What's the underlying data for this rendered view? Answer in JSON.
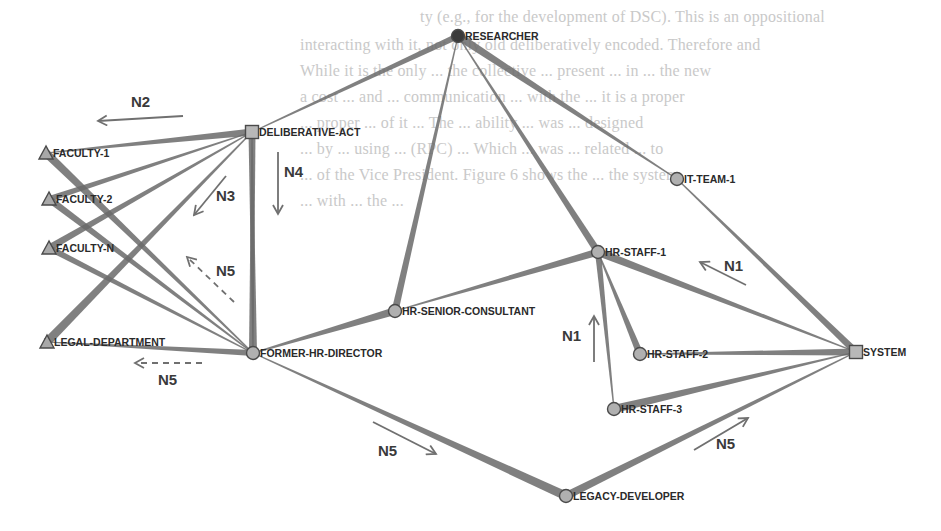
{
  "diagram": {
    "title": "",
    "type": "network",
    "background_text_lines": [
      "ty (e.g., for the development of DSC). This is an oppositional",
      "interacting with it, not only old deliberatively encoded. Therefore and",
      "While it is the only ... the collective ... present ... in ... the new",
      "a cost ... and ... communication ... with the ... it is a proper",
      "... proper ... of it ... The ... ability ... was ... designed",
      "... by ... using ... (RPC) ... Which ... was ... related ... to",
      "... of the Vice President. Figure 6 shows the ... the system",
      "... with ... the ..."
    ],
    "nodes": [
      {
        "id": "researcher",
        "label": "RESEARCHER",
        "shape": "circle",
        "fill": "#3a3a3a",
        "x": 458,
        "y": 36
      },
      {
        "id": "deliberative-act",
        "label": "DELIBERATIVE-ACT",
        "shape": "square",
        "fill": "#b8b8b8",
        "x": 252,
        "y": 132
      },
      {
        "id": "faculty-1",
        "label": "FACULTY-1",
        "shape": "triangle",
        "fill": "#a8a8a8",
        "x": 46,
        "y": 153
      },
      {
        "id": "faculty-2",
        "label": "FACULTY-2",
        "shape": "triangle",
        "fill": "#a8a8a8",
        "x": 49,
        "y": 199
      },
      {
        "id": "faculty-n",
        "label": "FACULTY-N",
        "shape": "triangle",
        "fill": "#a8a8a8",
        "x": 49,
        "y": 248
      },
      {
        "id": "legal-department",
        "label": "LEGAL-DEPARTMENT",
        "shape": "triangle",
        "fill": "#a8a8a8",
        "x": 47,
        "y": 342
      },
      {
        "id": "former-hr-director",
        "label": "FORMER-HR-DIRECTOR",
        "shape": "circle",
        "fill": "#b0b0b0",
        "x": 253,
        "y": 353
      },
      {
        "id": "hr-senior-consultant",
        "label": "HR-SENIOR-CONSULTANT",
        "shape": "circle",
        "fill": "#b0b0b0",
        "x": 395,
        "y": 311
      },
      {
        "id": "it-team-1",
        "label": "IT-TEAM-1",
        "shape": "circle",
        "fill": "#b0b0b0",
        "x": 677,
        "y": 179
      },
      {
        "id": "hr-staff-1",
        "label": "HR-STAFF-1",
        "shape": "circle",
        "fill": "#b0b0b0",
        "x": 598,
        "y": 252
      },
      {
        "id": "hr-staff-2",
        "label": "HR-STAFF-2",
        "shape": "circle",
        "fill": "#b0b0b0",
        "x": 640,
        "y": 354
      },
      {
        "id": "hr-staff-3",
        "label": "HR-STAFF-3",
        "shape": "circle",
        "fill": "#b0b0b0",
        "x": 614,
        "y": 409
      },
      {
        "id": "system",
        "label": "SYSTEM",
        "shape": "square",
        "fill": "#b8b8b8",
        "x": 856,
        "y": 352
      },
      {
        "id": "legacy-developer",
        "label": "LEGACY-DEVELOPER",
        "shape": "circle",
        "fill": "#b0b0b0",
        "x": 566,
        "y": 496
      }
    ],
    "edges": [
      {
        "from": "deliberative-act",
        "to": "researcher",
        "thick_end": "researcher",
        "w": 6
      },
      {
        "from": "former-hr-director",
        "to": "deliberative-act",
        "thick_end": "deliberative-act",
        "w": 7
      },
      {
        "from": "faculty-1",
        "to": "deliberative-act",
        "thick_end": "deliberative-act",
        "w": 7
      },
      {
        "from": "faculty-2",
        "to": "deliberative-act",
        "thick_end": "faculty-2",
        "w": 6
      },
      {
        "from": "faculty-n",
        "to": "deliberative-act",
        "thick_end": "faculty-n",
        "w": 7
      },
      {
        "from": "legal-department",
        "to": "deliberative-act",
        "thick_end": "legal-department",
        "w": 9
      },
      {
        "from": "faculty-1",
        "to": "former-hr-director",
        "thick_end": "faculty-1",
        "w": 8
      },
      {
        "from": "faculty-2",
        "to": "former-hr-director",
        "thick_end": "faculty-2",
        "w": 7
      },
      {
        "from": "faculty-n",
        "to": "former-hr-director",
        "thick_end": "faculty-n",
        "w": 6
      },
      {
        "from": "legal-department",
        "to": "former-hr-director",
        "thick_end": "former-hr-director",
        "w": 6
      },
      {
        "from": "former-hr-director",
        "to": "deliberative-act",
        "thick_end": "former-hr-director",
        "w": 8,
        "extra": true
      },
      {
        "from": "former-hr-director",
        "to": "hr-senior-consultant",
        "thick_end": "hr-senior-consultant",
        "w": 8
      },
      {
        "from": "hr-senior-consultant",
        "to": "researcher",
        "thick_end": "hr-senior-consultant",
        "w": 7
      },
      {
        "from": "researcher",
        "to": "hr-staff-1",
        "thick_end": "hr-staff-1",
        "w": 7
      },
      {
        "from": "researcher",
        "to": "it-team-1",
        "thick_end": "researcher",
        "w": 8
      },
      {
        "from": "it-team-1",
        "to": "system",
        "thick_end": "system",
        "w": 7
      },
      {
        "from": "hr-senior-consultant",
        "to": "hr-staff-1",
        "thick_end": "hr-staff-1",
        "w": 7
      },
      {
        "from": "hr-staff-1",
        "to": "system",
        "thick_end": "hr-staff-1",
        "w": 8
      },
      {
        "from": "hr-staff-1",
        "to": "hr-staff-2",
        "thick_end": "hr-staff-2",
        "w": 7
      },
      {
        "from": "hr-staff-1",
        "to": "hr-staff-3",
        "thick_end": "hr-staff-1",
        "w": 6
      },
      {
        "from": "hr-staff-2",
        "to": "system",
        "thick_end": "system",
        "w": 7
      },
      {
        "from": "hr-staff-3",
        "to": "system",
        "thick_end": "hr-staff-3",
        "w": 8
      },
      {
        "from": "former-hr-director",
        "to": "legacy-developer",
        "thick_end": "legacy-developer",
        "w": 9
      },
      {
        "from": "legacy-developer",
        "to": "system",
        "thick_end": "legacy-developer",
        "w": 8
      }
    ],
    "flow_annotations": [
      {
        "label": "N2",
        "label_x": 131,
        "label_y": 107,
        "arrow": {
          "x1": 183,
          "y1": 116,
          "x2": 98,
          "y2": 121
        },
        "dashed": false
      },
      {
        "label": "N4",
        "label_x": 284,
        "label_y": 177,
        "arrow": {
          "x1": 278,
          "y1": 152,
          "x2": 278,
          "y2": 214
        },
        "dashed": false
      },
      {
        "label": "N3",
        "label_x": 216,
        "label_y": 201,
        "arrow": {
          "x1": 226,
          "y1": 176,
          "x2": 194,
          "y2": 215
        },
        "dashed": false
      },
      {
        "label": "N5",
        "label_x": 216,
        "label_y": 276,
        "arrow": {
          "x1": 234,
          "y1": 302,
          "x2": 187,
          "y2": 257
        },
        "dashed": true
      },
      {
        "label": "N5",
        "label_x": 158,
        "label_y": 385,
        "arrow": {
          "x1": 202,
          "y1": 363,
          "x2": 135,
          "y2": 363
        },
        "dashed": true
      },
      {
        "label": "N5",
        "label_x": 378,
        "label_y": 456,
        "arrow": {
          "x1": 373,
          "y1": 422,
          "x2": 436,
          "y2": 454
        },
        "dashed": false
      },
      {
        "label": "N1",
        "label_x": 724,
        "label_y": 271,
        "arrow": {
          "x1": 746,
          "y1": 285,
          "x2": 700,
          "y2": 262
        },
        "dashed": false
      },
      {
        "label": "N1",
        "label_x": 562,
        "label_y": 341,
        "arrow": {
          "x1": 594,
          "y1": 362,
          "x2": 594,
          "y2": 316
        },
        "dashed": false
      },
      {
        "label": "N5",
        "label_x": 716,
        "label_y": 449,
        "arrow": {
          "x1": 694,
          "y1": 450,
          "x2": 748,
          "y2": 418
        },
        "dashed": false
      }
    ],
    "colors": {
      "edge": "#6a6a6a",
      "node_stroke": "#4a4a4a",
      "arrow": "#707070",
      "label": "#2a2a2a"
    }
  }
}
